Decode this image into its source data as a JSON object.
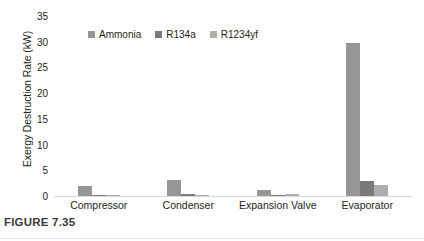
{
  "caption": {
    "text": "FIGURE 7.35"
  },
  "chart_data": {
    "type": "bar",
    "title": "",
    "xlabel": "",
    "ylabel": "Exergy Destruction Rate (kW)",
    "ylim": [
      0,
      35
    ],
    "yticks": [
      0,
      5,
      10,
      15,
      20,
      25,
      30,
      35
    ],
    "ytick_labels": [
      "0",
      "5",
      "10",
      "15",
      "20",
      "25",
      "30",
      "35"
    ],
    "grid": false,
    "legend_position": "top-left",
    "categories": [
      "Compressor",
      "Condenser",
      "Expansion Valve",
      "Evaporator"
    ],
    "series": [
      {
        "name": "Ammonia",
        "color": "#969696",
        "values": [
          1.9,
          3.1,
          1.2,
          29.7
        ]
      },
      {
        "name": "R134a",
        "color": "#7a7a7a",
        "values": [
          0.2,
          0.3,
          0.25,
          3.0
        ]
      },
      {
        "name": "R1234yf",
        "color": "#adadad",
        "values": [
          0.2,
          0.2,
          0.3,
          2.1
        ]
      }
    ]
  },
  "colors": {
    "axis_line": "#d9d9d9",
    "text": "#231f20",
    "caption_text": "#3a3a3a",
    "rule": "#e2e2e2"
  }
}
